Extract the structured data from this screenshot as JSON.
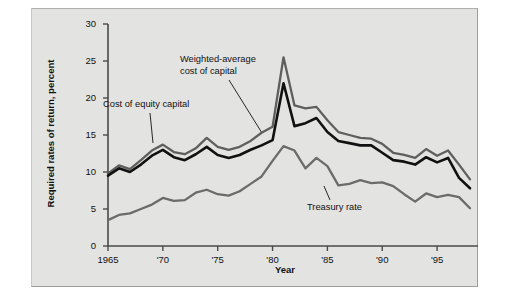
{
  "figure": {
    "background": "#e3e3e1",
    "page_background": "#ffffff"
  },
  "axes": {
    "y_title": "Required rates of return, percent",
    "x_title": "Year",
    "y_ticks": [
      "0",
      "5",
      "10",
      "15",
      "20",
      "25",
      "30"
    ],
    "x_ticks": [
      "1965",
      "'70",
      "'75",
      "'80",
      "'85",
      "'90",
      "'95"
    ]
  },
  "annotations": {
    "cost_of_equity": "Cost of equity capital",
    "wacc_line1": "Weighted-average",
    "wacc_line2": "cost of capital",
    "treasury": "Treasury rate"
  },
  "colors": {
    "cost_of_equity": "#5f5f5f",
    "wacc": "#111111",
    "treasury": "#6b6b6b",
    "axis": "#4a4a4a",
    "panel": "#e3e3e1"
  },
  "chart_data": {
    "type": "line",
    "title": "",
    "xlabel": "Year",
    "ylabel": "Required rates of return, percent",
    "xlim": [
      1965,
      1998
    ],
    "ylim": [
      0,
      30
    ],
    "grid": false,
    "legend": "annotated-inline",
    "x": [
      1965,
      1966,
      1967,
      1968,
      1969,
      1970,
      1971,
      1972,
      1973,
      1974,
      1975,
      1976,
      1977,
      1978,
      1979,
      1980,
      1981,
      1982,
      1983,
      1984,
      1985,
      1986,
      1987,
      1988,
      1989,
      1990,
      1991,
      1992,
      1993,
      1994,
      1995,
      1996,
      1997,
      1998
    ],
    "series": [
      {
        "name": "Cost of equity capital",
        "color": "#5f5f5f",
        "values": [
          9.8,
          10.9,
          10.4,
          11.6,
          12.9,
          13.7,
          12.7,
          12.4,
          13.2,
          14.6,
          13.4,
          13.0,
          13.4,
          14.2,
          15.3,
          16.1,
          25.5,
          19.0,
          18.6,
          18.8,
          17.0,
          15.4,
          15.0,
          14.6,
          14.5,
          13.8,
          12.6,
          12.3,
          11.9,
          13.1,
          12.2,
          12.9,
          11.0,
          9.0
        ]
      },
      {
        "name": "Weighted-average cost of capital",
        "color": "#111111",
        "values": [
          9.5,
          10.5,
          10.0,
          11.0,
          12.2,
          13.0,
          12.0,
          11.6,
          12.4,
          13.4,
          12.3,
          11.9,
          12.3,
          13.0,
          13.6,
          14.3,
          22.0,
          16.2,
          16.6,
          17.3,
          15.4,
          14.2,
          13.9,
          13.6,
          13.6,
          12.6,
          11.6,
          11.4,
          11.0,
          12.0,
          11.3,
          11.9,
          9.2,
          7.8
        ]
      },
      {
        "name": "Treasury rate",
        "color": "#6b6b6b",
        "values": [
          3.5,
          4.2,
          4.4,
          5.0,
          5.6,
          6.5,
          6.1,
          6.2,
          7.2,
          7.6,
          7.0,
          6.8,
          7.4,
          8.4,
          9.4,
          11.5,
          13.5,
          12.9,
          10.5,
          11.9,
          10.8,
          8.2,
          8.4,
          8.9,
          8.5,
          8.6,
          8.1,
          7.0,
          6.0,
          7.1,
          6.6,
          6.9,
          6.6,
          5.1
        ]
      }
    ]
  }
}
